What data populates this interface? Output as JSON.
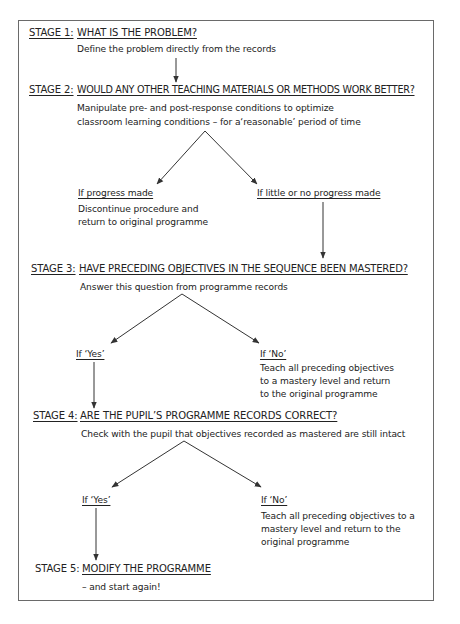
{
  "stages": [
    {
      "label": "STAGE 1:",
      "title": "WHAT IS THE PROBLEM?",
      "desc": [
        "Define the problem directly from the records"
      ]
    },
    {
      "label": "STAGE 2:",
      "title": "WOULD ANY OTHER TEACHING MATERIALS OR METHODS WORK BETTER?",
      "desc": [
        "Manipulate pre- and post-response conditions to optimize",
        "classroom learning conditions – for a‘reasonable’ period of time"
      ]
    },
    {
      "label": "STAGE 3:",
      "title": "HAVE PRECEDING OBJECTIVES IN THE SEQUENCE BEEN MASTERED?",
      "desc": [
        "Answer this question from programme records"
      ]
    },
    {
      "label": "STAGE 4:",
      "title": "ARE THE PUPIL’S PROGRAMME RECORDS CORRECT?",
      "desc": [
        "Check with the pupil that objectives recorded as mastered are still intact"
      ]
    },
    {
      "label": "STAGE 5:",
      "title": "MODIFY THE PROGRAMME",
      "desc": [
        "– and start again!"
      ]
    }
  ],
  "branches": {
    "stage2": {
      "left": {
        "label": "If progress made",
        "desc": [
          "Discontinue procedure and",
          "return to original programme"
        ]
      },
      "right": {
        "label": "If little or no progress made"
      }
    },
    "stage3": {
      "left": {
        "label": "If ‘Yes’"
      },
      "right": {
        "label": "If ‘No’",
        "desc": [
          "Teach all preceding objectives",
          "to a mastery level and return",
          "to the original programme"
        ]
      }
    },
    "stage4": {
      "left": {
        "label": "If ‘Yes’"
      },
      "right": {
        "label": "If ‘No’",
        "desc": [
          "Teach all preceding objectives to a",
          "mastery level and return to the",
          "original programme"
        ]
      }
    }
  },
  "colors": {
    "line": "#333333",
    "frame": "#6a6a6a",
    "text": "#222222"
  }
}
